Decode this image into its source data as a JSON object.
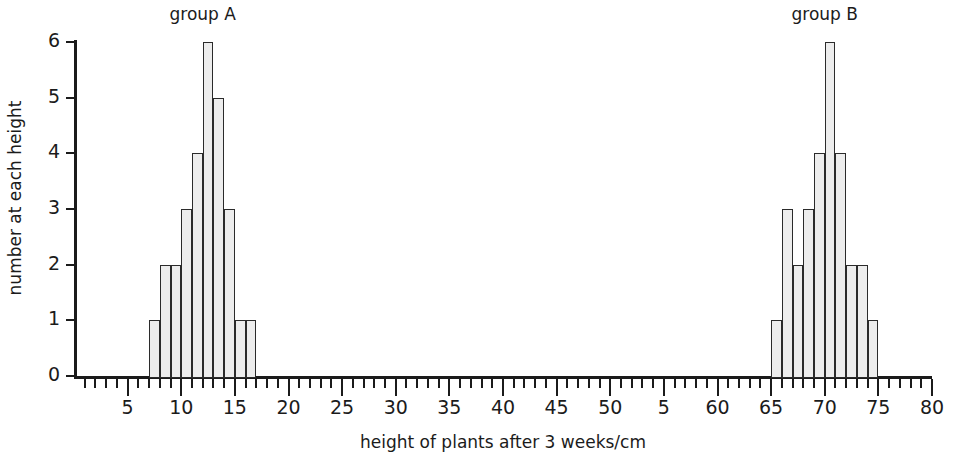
{
  "chart": {
    "type": "bar",
    "xlabel": "height of plants after 3 weeks/cm",
    "ylabel": "number at each height",
    "group_a_caption": "group A",
    "group_b_caption": "group B"
  },
  "chart_data": {
    "type": "bar",
    "title": "",
    "subtitle": "",
    "xlabel": "height of plants after 3 weeks/cm",
    "ylabel": "number at each height",
    "xlim": [
      0,
      80
    ],
    "ylim": [
      0,
      6
    ],
    "grid": false,
    "legend": "none",
    "bin_width": 1,
    "annotations": [
      "group A",
      "group B"
    ],
    "xtick_labels": [
      "5",
      "10",
      "15",
      "20",
      "25",
      "30",
      "35",
      "40",
      "45",
      "50",
      "5",
      "60",
      "65",
      "70",
      "75",
      "80"
    ],
    "xtick_values": [
      5,
      10,
      15,
      20,
      25,
      30,
      35,
      40,
      45,
      50,
      55,
      60,
      65,
      70,
      75,
      80
    ],
    "ytick_labels": [
      "0",
      "1",
      "2",
      "3",
      "4",
      "5",
      "6"
    ],
    "ytick_values": [
      0,
      1,
      2,
      3,
      4,
      5,
      6
    ],
    "series": [
      {
        "name": "group A",
        "bins": [
          7,
          8,
          9,
          10,
          11,
          12,
          13,
          14,
          15,
          16
        ],
        "values": [
          1,
          2,
          2,
          3,
          4,
          6,
          5,
          3,
          1,
          1
        ],
        "range": [
          7,
          17
        ],
        "total": 28
      },
      {
        "name": "group B",
        "bins": [
          65,
          66,
          67,
          68,
          69,
          70,
          71,
          72,
          73,
          74
        ],
        "values": [
          1,
          3,
          2,
          3,
          4,
          6,
          4,
          2,
          2,
          1
        ],
        "range": [
          65,
          75
        ],
        "total": 28
      }
    ]
  },
  "colors": {
    "bar_fill": "#ededed",
    "bar_stroke": "#2b2b2b",
    "axis": "#1b1b1b",
    "background": "#ffffff"
  }
}
